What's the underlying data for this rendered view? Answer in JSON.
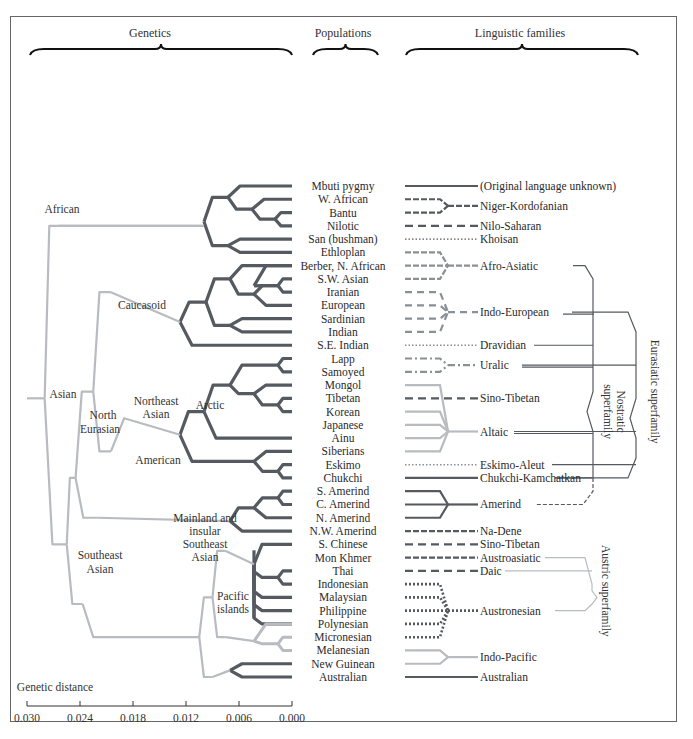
{
  "headers": {
    "genetics": "Genetics",
    "populations": "Populations",
    "linguistic": "Linguistic families"
  },
  "colors": {
    "dark": "#555a60",
    "mid": "#8a9096",
    "light": "#b8bcc0",
    "frame": "#666666"
  },
  "populations": [
    "Mbuti pygmy",
    "W. African",
    "Bantu",
    "Nilotic",
    "San (bushman)",
    "Ethloplan",
    "Berber, N. African",
    "S.W. Asian",
    "Iranian",
    "European",
    "Sardinian",
    "Indian",
    "S.E. Indian",
    "Lapp",
    "Samoyed",
    "Mongol",
    "Tibetan",
    "Korean",
    "Japanese",
    "Ainu",
    "Siberians",
    "Eskimo",
    "Chukchi",
    "S. Amerind",
    "C. Amerind",
    "N. Amerind",
    "N.W. Amerind",
    "S. Chinese",
    "Mon Khmer",
    "Thai",
    "Indonesian",
    "Malaysian",
    "Philippine",
    "Polynesian",
    "Micronesian",
    "Melanesian",
    "New Guinean",
    "Australian"
  ],
  "families": [
    {
      "name": "(Original language unknown)",
      "row": 0
    },
    {
      "name": "Niger-Kordofanian",
      "row": 1.5
    },
    {
      "name": "Nilo-Saharan",
      "row": 3
    },
    {
      "name": "Khoisan",
      "row": 4
    },
    {
      "name": "Afro-Asiatic",
      "row": 6
    },
    {
      "name": "Indo-European",
      "row": 9.5
    },
    {
      "name": "Dravidian",
      "row": 12
    },
    {
      "name": "Uralic",
      "row": 13.5
    },
    {
      "name": "Sino-Tibetan",
      "row": 16
    },
    {
      "name": "Altaic",
      "row": 18.5
    },
    {
      "name": "Eskimo-Aleut",
      "row": 21
    },
    {
      "name": "Chukchi-Kamchatkan",
      "row": 22
    },
    {
      "name": "Amerind",
      "row": 24
    },
    {
      "name": "Na-Dene",
      "row": 26
    },
    {
      "name": "Sino-Tibetan",
      "row": 27
    },
    {
      "name": "Austroasiatic",
      "row": 28
    },
    {
      "name": "Daic",
      "row": 29
    },
    {
      "name": "Austronesian",
      "row": 32
    },
    {
      "name": "Indo-Pacific",
      "row": 35.5
    },
    {
      "name": "Australian",
      "row": 37
    }
  ],
  "clade_labels": {
    "african": "African",
    "asian": "Asian",
    "caucasoid": "Caucasoid",
    "north_eurasian_1": "North",
    "north_eurasian_2": "Eurasian",
    "northeast_asian_1": "Northeast",
    "northeast_asian_2": "Asian",
    "arctic": "Arctic",
    "american": "American",
    "southeast_asian_1": "Southeast",
    "southeast_asian_2": "Asian",
    "mainland_1": "Mainland and",
    "mainland_2": "insular",
    "mainland_3": "Southeast",
    "mainland_4": "Asian",
    "pacific_1": "Pacific",
    "pacific_2": "islands"
  },
  "superfamilies": {
    "eurasiatic": "Eurasiatic superfamily",
    "nostratic_1": "Nostratic",
    "nostratic_2": "superfamily",
    "austric": "Austric superfamily"
  },
  "axis": {
    "title": "Genetic distance",
    "ticks": [
      "0.030",
      "0.024",
      "0.018",
      "0.012",
      "0.006",
      "0.000"
    ]
  }
}
